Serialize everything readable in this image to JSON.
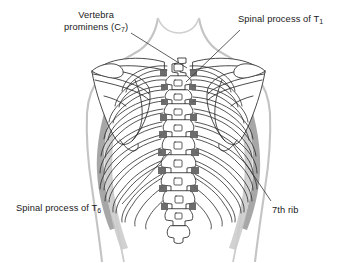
{
  "figure": {
    "background_color": "#ffffff",
    "line_color": "#1a1a1a",
    "shade_color": "#7c7c7c",
    "light_shade_color": "#cfcfcf"
  },
  "labels": [
    {
      "id": "vertebra-prominens",
      "line1": "Vertebra",
      "line2_prefix": "prominens (C",
      "subscript": "7",
      "line2_suffix": ")"
    },
    {
      "id": "spinal-process-t1",
      "prefix": "Spinal process of T",
      "subscript": "1",
      "suffix": ""
    },
    {
      "id": "spinal-process-t6",
      "prefix": "Spinal process of T",
      "subscript": "6",
      "suffix": ""
    },
    {
      "id": "seventh-rib",
      "text": "7th rib"
    }
  ],
  "leader_lines": [
    {
      "name": "leader-vertebra-prominens",
      "from": [
        131,
        31
      ],
      "to": [
        186,
        69
      ]
    },
    {
      "name": "leader-spinal-process-t1",
      "from": [
        237,
        28
      ],
      "to": [
        189,
        79
      ]
    },
    {
      "name": "leader-spinal-process-t6",
      "from": [
        120,
        205
      ],
      "to": [
        168,
        154
      ]
    },
    {
      "name": "leader-7th-rib",
      "from": [
        270,
        202
      ],
      "to": [
        232,
        146
      ]
    }
  ],
  "anatomy": {
    "structures": [
      "body-outline",
      "neck",
      "left-shoulder",
      "right-shoulder",
      "left-scapula",
      "right-scapula",
      "left-clavicle",
      "right-clavicle",
      "vertebral-column",
      "rib-cage-left",
      "rib-cage-right",
      "left-arm-shading",
      "right-arm-shading"
    ],
    "vertebra_count": 13,
    "rib_pairs": 12
  }
}
